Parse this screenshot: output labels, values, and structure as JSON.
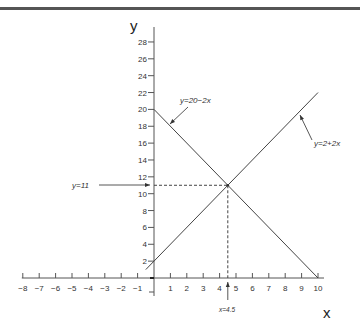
{
  "chart_data": {
    "type": "line",
    "title": "",
    "xlabel": "x",
    "ylabel": "y",
    "xlim": [
      -8,
      10
    ],
    "ylim": [
      0,
      28
    ],
    "x_ticks": [
      -8,
      -7,
      -6,
      -5,
      -4,
      -3,
      -2,
      -1,
      1,
      2,
      3,
      4,
      5,
      6,
      7,
      8,
      9,
      10
    ],
    "y_ticks": [
      2,
      4,
      6,
      8,
      10,
      12,
      14,
      16,
      18,
      20,
      22,
      24,
      26,
      28
    ],
    "grid": false,
    "legend": "none",
    "series": [
      {
        "name": "y=20−2x",
        "x": [
          0,
          10
        ],
        "y": [
          20,
          0
        ]
      },
      {
        "name": "y=2+2x",
        "x": [
          -0.5,
          10
        ],
        "y": [
          1,
          22
        ]
      }
    ],
    "annotations": [
      {
        "text": "y=20−2x",
        "points_to": "line y=20-2x"
      },
      {
        "text": "y=2+2x",
        "points_to": "line y=2+2x"
      },
      {
        "text": "y=11",
        "points_to": "y-axis at 11"
      },
      {
        "text": "x=4.5",
        "points_to": "x-axis at 4.5"
      }
    ],
    "intersection": {
      "x": 4.5,
      "y": 11
    }
  },
  "labels": {
    "x_axis_title": "x",
    "y_axis_title": "y",
    "line1_label": "y=20−2x",
    "line2_label": "y=2+2x",
    "y_eq_label": "y=11",
    "x_eq_label": "x=4.5"
  }
}
